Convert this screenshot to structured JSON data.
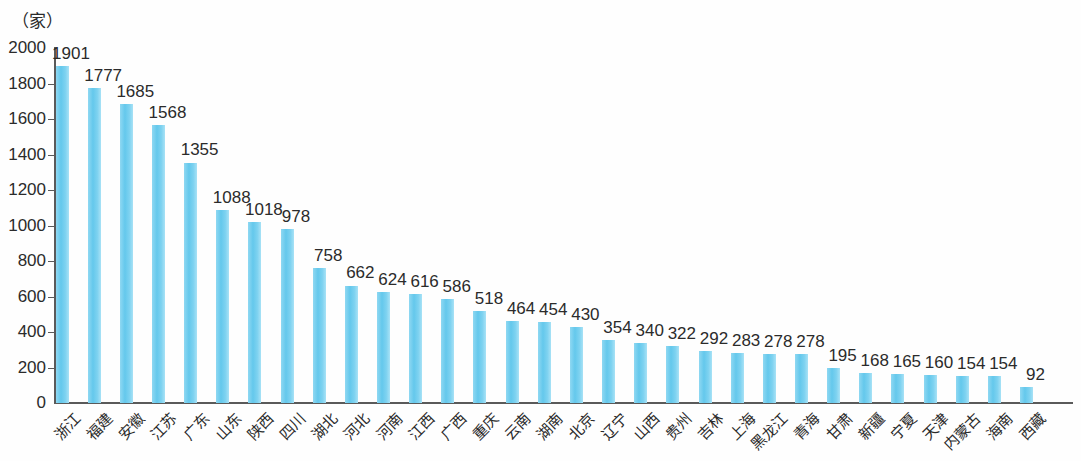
{
  "chart_data": {
    "type": "bar",
    "title": "",
    "subtitle": "",
    "unit_label": "（家）",
    "xlabel": "",
    "ylabel": "",
    "ylim": [
      0,
      2000
    ],
    "y_ticks": [
      0,
      200,
      400,
      600,
      800,
      1000,
      1200,
      1400,
      1600,
      1800,
      2000
    ],
    "grid": false,
    "legend": null,
    "bar_color": "#6ECFF0",
    "axis_color": "#5A5A5A",
    "text_color": "#2B2B2B",
    "categories": [
      "浙江",
      "福建",
      "安徽",
      "江苏",
      "广东",
      "山东",
      "陕西",
      "四川",
      "湖北",
      "河北",
      "河南",
      "江西",
      "广西",
      "重庆",
      "云南",
      "湖南",
      "北京",
      "辽宁",
      "山西",
      "贵州",
      "吉林",
      "上海",
      "黑龙江",
      "青海",
      "甘肃",
      "新疆",
      "宁夏",
      "天津",
      "内蒙古",
      "海南",
      "西藏"
    ],
    "values": [
      1901,
      1777,
      1685,
      1568,
      1355,
      1088,
      1018,
      978,
      758,
      662,
      624,
      616,
      586,
      518,
      464,
      454,
      430,
      354,
      340,
      322,
      292,
      283,
      278,
      278,
      195,
      168,
      165,
      160,
      154,
      154,
      92
    ]
  }
}
